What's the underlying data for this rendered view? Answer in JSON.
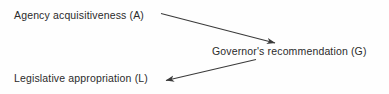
{
  "diagram": {
    "type": "flow-diagram",
    "background_color": "#fefefe",
    "text_color": "#2b2b2b",
    "arrow_color": "#3a3a3a",
    "nodes": [
      {
        "id": "A",
        "label": "Agency acquisitiveness (A)"
      },
      {
        "id": "G",
        "label": "Governor's recommendation (G)"
      },
      {
        "id": "L",
        "label": "Legislative appropriation (L)"
      }
    ],
    "edges": [
      {
        "from": "A",
        "to": "G",
        "direction": "down-right",
        "arrowhead": "end"
      },
      {
        "from": "G",
        "to": "L",
        "direction": "down-left",
        "arrowhead": "end"
      }
    ]
  }
}
